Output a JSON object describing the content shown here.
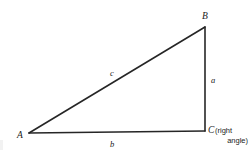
{
  "figure": {
    "type": "right-triangle-diagram",
    "background_color": "#ffffff",
    "stroke_color": "#262626",
    "text_color": "#1a1a1a"
  },
  "vertices": [
    {
      "id": "A",
      "label": "A",
      "x": 29,
      "y": 133
    },
    {
      "id": "B",
      "label": "B",
      "x": 205,
      "y": 27
    },
    {
      "id": "C",
      "label": "C",
      "x": 205,
      "y": 131
    }
  ],
  "sides": [
    {
      "id": "a",
      "label": "a",
      "from": "B",
      "to": "C",
      "role": "opposite-leg-vertical"
    },
    {
      "id": "b",
      "label": "b",
      "from": "A",
      "to": "C",
      "role": "adjacent-leg-horizontal"
    },
    {
      "id": "c",
      "label": "c",
      "from": "A",
      "to": "B",
      "role": "hypotenuse"
    }
  ],
  "annotations": {
    "right_angle_vertex": "C",
    "right_angle_note_line1": "(right",
    "right_angle_note_line2": "angle)"
  }
}
